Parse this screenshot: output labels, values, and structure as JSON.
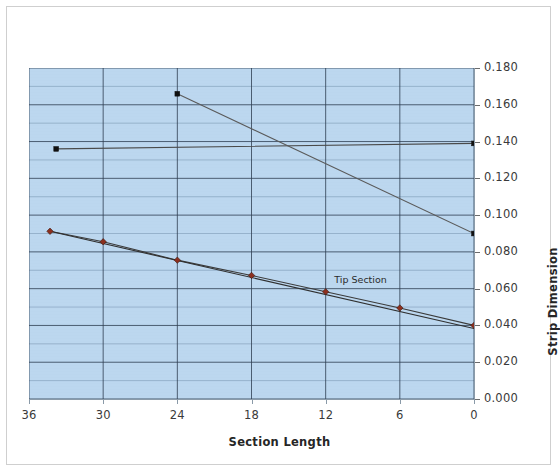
{
  "chart_data": {
    "type": "line",
    "title": "",
    "xlabel": "Section Length",
    "ylabel": "Strip Dimension",
    "xlim": [
      36,
      0
    ],
    "ylim": [
      0.0,
      0.18
    ],
    "x_reversed": true,
    "grid": true,
    "legend_position": "none",
    "xticks": [
      "36",
      "30",
      "24",
      "18",
      "12",
      "6",
      "0"
    ],
    "xtick_values": [
      36,
      30,
      24,
      18,
      12,
      6,
      0
    ],
    "yticks": [
      "0.000",
      "0.020",
      "0.040",
      "0.060",
      "0.080",
      "0.100",
      "0.120",
      "0.140",
      "0.160",
      "0.180"
    ],
    "ytick_values": [
      0.0,
      0.02,
      0.04,
      0.06,
      0.08,
      0.1,
      0.12,
      0.14,
      0.16,
      0.18
    ],
    "y_axis_side": "right",
    "minor_gridlines_y": true,
    "annotations": [
      {
        "text": "Tip Section",
        "x": 11.3,
        "y": 0.064
      }
    ],
    "series": [
      {
        "name": "Upper Taper A",
        "color": "#4a4a4a",
        "marker": "square",
        "marker_color": "#101010",
        "points": [
          {
            "x": 33.8,
            "y": 0.136
          },
          {
            "x": 0.0,
            "y": 0.139
          }
        ]
      },
      {
        "name": "Upper Taper B",
        "color": "#5a5a5a",
        "marker": "square",
        "marker_color": "#101010",
        "points": [
          {
            "x": 24.0,
            "y": 0.166
          },
          {
            "x": 0.0,
            "y": 0.09
          }
        ]
      },
      {
        "name": "Strip Dimension (measured)",
        "color": "#3b3b3b",
        "marker": "diamond",
        "marker_color": "#8c2f1e",
        "points": [
          {
            "x": 34.3,
            "y": 0.0912
          },
          {
            "x": 30.0,
            "y": 0.0855
          },
          {
            "x": 24.0,
            "y": 0.0755
          },
          {
            "x": 18.0,
            "y": 0.0672
          },
          {
            "x": 12.0,
            "y": 0.0583
          },
          {
            "x": 6.0,
            "y": 0.0495
          },
          {
            "x": 0.0,
            "y": 0.04
          }
        ]
      },
      {
        "name": "Strip Dimension (trend)",
        "color": "#2f2f2f",
        "marker": "none",
        "marker_color": "#2f2f2f",
        "points": [
          {
            "x": 34.3,
            "y": 0.0912
          },
          {
            "x": 0.0,
            "y": 0.0383
          }
        ]
      }
    ],
    "colors": {
      "plot_background": "#bcd7ef",
      "major_gridline": "#2f3f52",
      "minor_gridline": "#7e9ab5",
      "marker_red": "#8c2f1e",
      "marker_black": "#101010",
      "frame_border": "#cfcfcf"
    }
  }
}
